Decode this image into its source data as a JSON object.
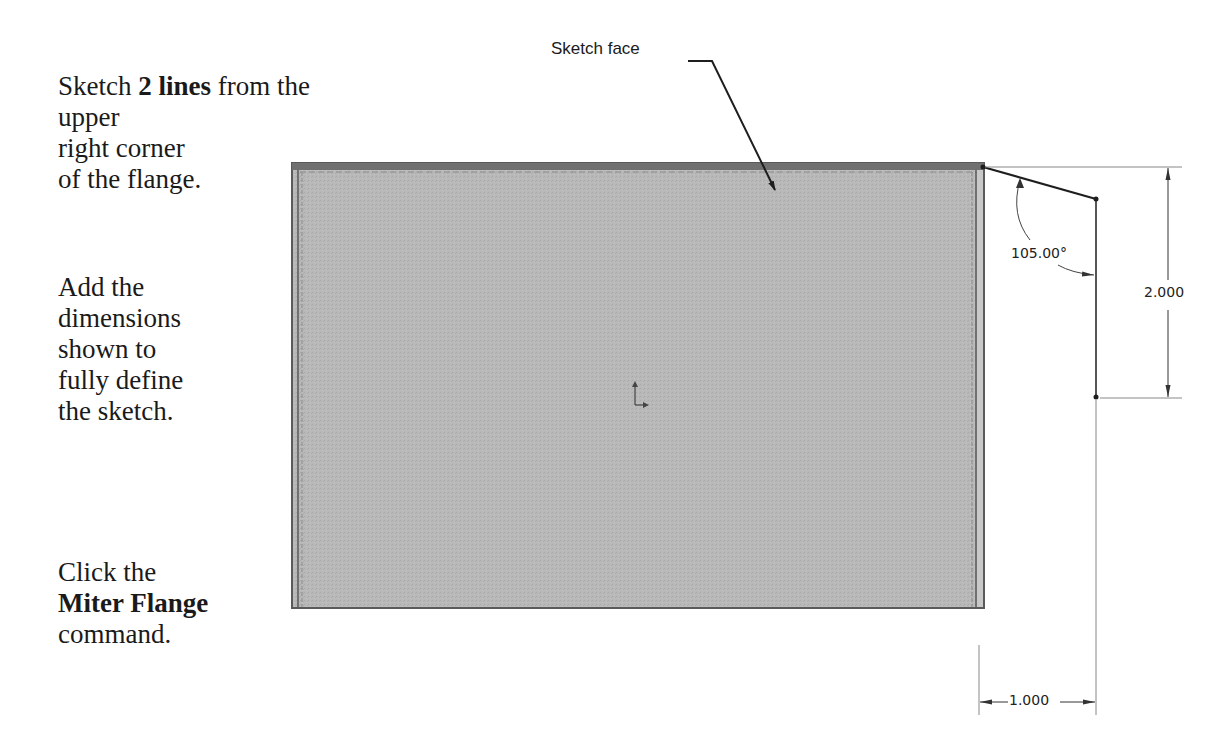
{
  "instructions": {
    "step1": {
      "pre": "Sketch ",
      "bold": "2 lines",
      "post": " from the upper right corner of the flange.",
      "line2": "right corner",
      "line3": "of the flange.",
      "line1_post": " from the upper"
    },
    "step2": {
      "lines": [
        "Add the",
        "dimensions",
        "shown to",
        "fully define",
        "the sketch."
      ]
    },
    "step3": {
      "line1": "Click the",
      "bold": "Miter Flange",
      "line3": "command."
    }
  },
  "callout": {
    "label": "Sketch face"
  },
  "dimensions": {
    "angle": "105.00°",
    "height": "2.000",
    "width": "1.000"
  },
  "colors": {
    "flange_face": "#b9b9b9",
    "flange_edge": "#6e6e6e",
    "sketch_line": "#1e1e1e"
  }
}
